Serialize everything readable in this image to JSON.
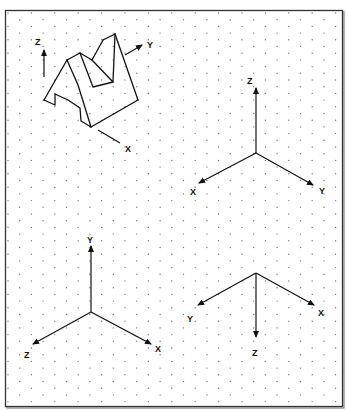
{
  "figure": {
    "colors": {
      "line": "#111111",
      "dot": "#777777",
      "background": "#ffffff",
      "border": "#333333"
    }
  },
  "object_view": {
    "axis_labels": {
      "z": "Z",
      "y": "Y",
      "x": "X"
    }
  },
  "triad_top_right": {
    "labels": {
      "z": "Z",
      "x": "X",
      "y": "Y"
    }
  },
  "triad_bottom_left": {
    "labels": {
      "y": "Y",
      "z": "Z",
      "x": "X"
    }
  },
  "triad_bottom_right": {
    "labels": {
      "y": "Y",
      "x": "X",
      "z": "Z"
    }
  }
}
